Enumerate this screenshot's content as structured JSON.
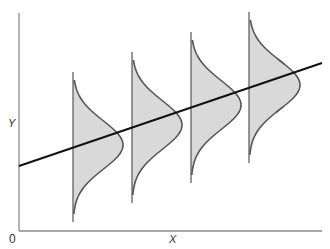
{
  "diagram": {
    "type": "regression-conditional-distributions",
    "axes": {
      "origin_label": "0",
      "x_label": "X",
      "y_label": "Y"
    },
    "colors": {
      "axis": "#8c8c8c",
      "line": "#111111",
      "curve_stroke": "#555555",
      "curve_fill": "#d9d9d9"
    },
    "regression_line": {
      "x1": 19,
      "y1": 166,
      "x2": 322,
      "y2": 63
    },
    "distributions": [
      {
        "baseline_x": 73,
        "top_y": 72,
        "bottom_y": 222,
        "peak_y": 145,
        "peak_width": 50
      },
      {
        "baseline_x": 132,
        "top_y": 52,
        "bottom_y": 203,
        "peak_y": 125,
        "peak_width": 50
      },
      {
        "baseline_x": 191,
        "top_y": 32,
        "bottom_y": 183,
        "peak_y": 105,
        "peak_width": 50
      },
      {
        "baseline_x": 249,
        "top_y": 12,
        "bottom_y": 163,
        "peak_y": 85,
        "peak_width": 51
      }
    ]
  }
}
